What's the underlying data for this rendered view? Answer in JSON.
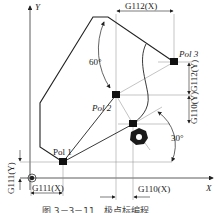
{
  "axes": {
    "x_label": "X",
    "y_label": "Y"
  },
  "poles": [
    {
      "label": "Pol 1"
    },
    {
      "label": "Pol 2"
    },
    {
      "label": "Pol 3"
    }
  ],
  "dimensions": {
    "g111_x": "G111(X)",
    "g111_y": "G111(Y)",
    "g110_x": "G110(X)",
    "g110_y": "G110(Y)",
    "g112_x": "G112(X)",
    "g112_y": "G112(Y)"
  },
  "angles": {
    "angle_1": "60°",
    "angle_2": "30°"
  },
  "caption": "图 3－3－11　极点标编程",
  "colors": {
    "line": "#222222",
    "thin": "#666666",
    "marker": "#111111"
  }
}
